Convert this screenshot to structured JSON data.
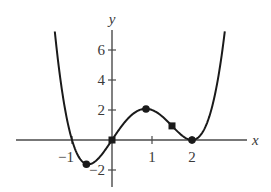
{
  "chart_data": {
    "type": "line",
    "title": "",
    "xlabel": "x",
    "ylabel": "y",
    "function": "y = x(x+1)(x-2)^2",
    "xlim": [
      -2.4,
      3.4
    ],
    "ylim": [
      -3.1,
      7.3
    ],
    "grid": false,
    "legend": null,
    "x_ticks": [
      {
        "value": -1,
        "label": "−1"
      },
      {
        "value": 1,
        "label": "1"
      },
      {
        "value": 2,
        "label": "2"
      }
    ],
    "y_ticks": [
      {
        "value": 6,
        "label": "6"
      },
      {
        "value": 4,
        "label": "4"
      },
      {
        "value": 2,
        "label": "2"
      },
      {
        "value": -2,
        "label": "−2"
      }
    ],
    "curve_domain": [
      -1.43,
      2.82
    ],
    "points": [
      {
        "x": -0.64,
        "y": -1.62,
        "marker": "circle"
      },
      {
        "x": 0,
        "y": 0,
        "marker": "square"
      },
      {
        "x": 0.85,
        "y": 2.07,
        "marker": "circle"
      },
      {
        "x": 1.5,
        "y": 0.94,
        "marker": "square"
      },
      {
        "x": 2,
        "y": 0,
        "marker": "circle"
      }
    ],
    "colors": {
      "curve": "#1a1a1a",
      "axis": "#4a4a4a",
      "text": "#3a3a3a"
    }
  }
}
